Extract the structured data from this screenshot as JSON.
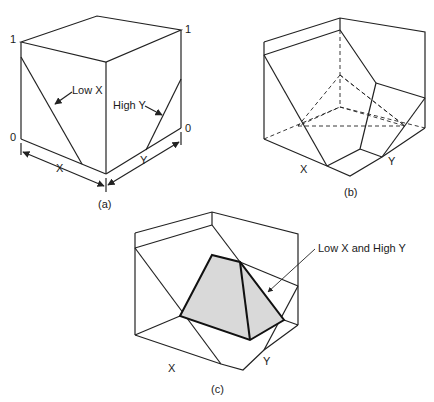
{
  "panels": {
    "a": {
      "caption": "(a)",
      "axis_top_left": "1",
      "axis_top_right": "1",
      "axis_bottom_left": "0",
      "axis_bottom_right": "0",
      "x_label": "X",
      "y_label": "Y",
      "low_x_label": "Low X",
      "high_y_label": "High Y"
    },
    "b": {
      "caption": "(b)",
      "x_label": "X",
      "y_label": "Y"
    },
    "c": {
      "caption": "(c)",
      "x_label": "X",
      "y_label": "Y",
      "region_label": "Low X and High Y",
      "shade_color": "#d9d9d9"
    }
  }
}
